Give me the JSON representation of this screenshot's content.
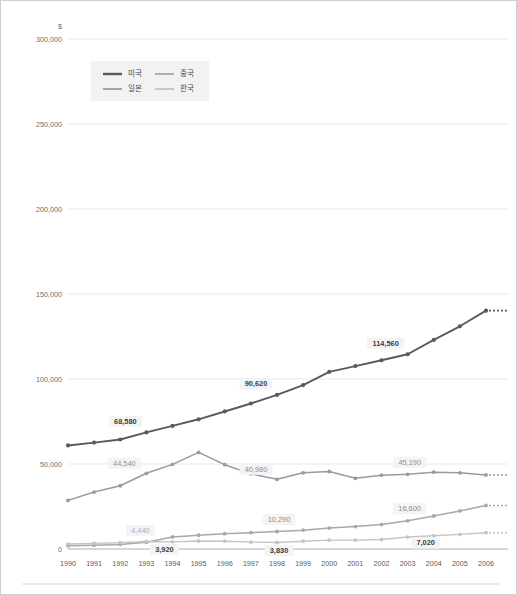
{
  "chart_data": {
    "type": "line",
    "title": "",
    "subtitle": "",
    "xlabel": "",
    "ylabel": "",
    "unit_label": "$",
    "grid": true,
    "legend_position": "top-left-inside",
    "x": [
      1990,
      1991,
      1992,
      1993,
      1994,
      1995,
      1996,
      1997,
      1998,
      1999,
      2000,
      2001,
      2002,
      2003,
      2004,
      2005,
      2006
    ],
    "xtick_labels": [
      "1990",
      "1991",
      "1992",
      "1993",
      "1994",
      "1995",
      "1996",
      "1997",
      "1998",
      "1999",
      "2000",
      "2001",
      "2002",
      "2003",
      "2004",
      "2005",
      "2006"
    ],
    "ylim": [
      0,
      300000
    ],
    "ytick_values": [
      0,
      50000,
      100000,
      150000,
      200000,
      250000,
      300000
    ],
    "ytick_labels": [
      "0",
      "50,000",
      "100,000",
      "150,000",
      "200,000",
      "250,000",
      "300,000"
    ],
    "series": [
      {
        "name": "미국",
        "color": "#5a5a5a",
        "values": [
          60900,
          62600,
          64400,
          68580,
          72400,
          76300,
          80900,
          85600,
          90620,
          96400,
          104200,
          107600,
          111000,
          114560,
          123000,
          131000,
          140200
        ]
      },
      {
        "name": "일본",
        "color": "#9a9a9a",
        "values": [
          28600,
          33500,
          37200,
          44540,
          49800,
          56800,
          49600,
          44200,
          40980,
          44800,
          45600,
          41600,
          43400,
          43900,
          45190,
          44800,
          43600
        ]
      },
      {
        "name": "중국",
        "color": "#a8a8a8",
        "values": [
          1900,
          2200,
          2700,
          3920,
          7100,
          8100,
          9000,
          9600,
          10290,
          11100,
          12300,
          13200,
          14400,
          16600,
          19400,
          22400,
          25600
        ]
      },
      {
        "name": "한국",
        "color": "#c4c4c4",
        "values": [
          2900,
          3300,
          3700,
          4440,
          4200,
          4700,
          4600,
          4100,
          3830,
          4600,
          5200,
          5200,
          5600,
          7020,
          7800,
          8600,
          9600
        ]
      }
    ],
    "data_labels": [
      {
        "series": "미국",
        "year": 1993,
        "value": 68580,
        "text": "68,580",
        "style": "dark"
      },
      {
        "series": "미국",
        "year": 1998,
        "value": 90620,
        "text": "90,620",
        "style": "dark"
      },
      {
        "series": "미국",
        "year": 2003,
        "value": 114560,
        "text": "114,560",
        "style": "dark"
      },
      {
        "series": "일본",
        "year": 1993,
        "value": 44540,
        "text": "44,540",
        "style": "mid"
      },
      {
        "series": "일본",
        "year": 1998,
        "value": 40980,
        "text": "40,980",
        "style": "mid"
      },
      {
        "series": "일본",
        "year": 2004,
        "value": 45190,
        "text": "45,190",
        "style": "mid"
      },
      {
        "series": "중국",
        "year": 1993,
        "value": 3920,
        "text": "3,920",
        "style": "dark"
      },
      {
        "series": "중국",
        "year": 1998,
        "value": 10290,
        "text": "10,290",
        "style": "mid"
      },
      {
        "series": "중국",
        "year": 2003,
        "value": 16600,
        "text": "16,600",
        "style": "mid"
      },
      {
        "series": "한국",
        "year": 1993,
        "value": 4440,
        "text": "4,440",
        "style": "light"
      },
      {
        "series": "한국",
        "year": 1998,
        "value": 3830,
        "text": "3,830",
        "style": "dark"
      },
      {
        "series": "한국",
        "year": 2003,
        "value": 7020,
        "text": "7,020",
        "style": "dark"
      }
    ]
  },
  "legend": {
    "items": [
      {
        "label": "미국",
        "color": "#5a5a5a"
      },
      {
        "label": "중국",
        "color": "#a8a8a8"
      },
      {
        "label": "일본",
        "color": "#9a9a9a"
      },
      {
        "label": "한국",
        "color": "#c4c4c4"
      }
    ]
  }
}
